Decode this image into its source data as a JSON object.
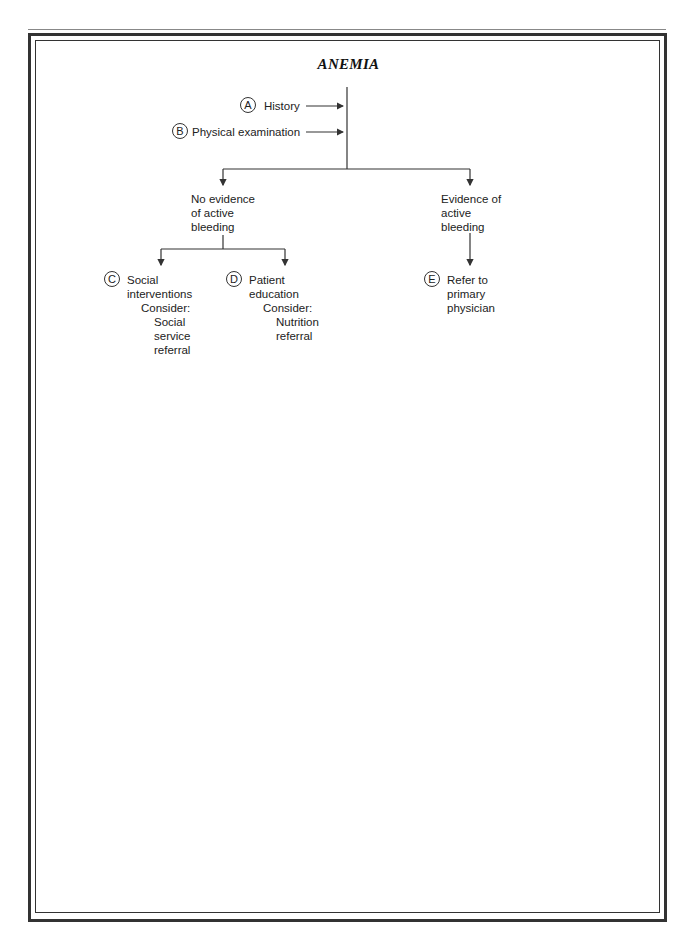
{
  "title": "ANEMIA",
  "nodes": {
    "A": {
      "letter": "A",
      "label": "History"
    },
    "B": {
      "letter": "B",
      "label": "Physical examination"
    },
    "no_bleed": {
      "lines": [
        "No evidence",
        "of active",
        "bleeding"
      ]
    },
    "bleed": {
      "lines": [
        "Evidence of",
        "active",
        "bleeding"
      ]
    },
    "C": {
      "letter": "C",
      "lines": [
        "Social",
        "interventions",
        "Consider:",
        "Social",
        "service",
        "referral"
      ]
    },
    "D": {
      "letter": "D",
      "lines": [
        "Patient",
        "education",
        "Consider:",
        "Nutrition",
        "referral"
      ]
    },
    "E": {
      "letter": "E",
      "lines": [
        "Refer to",
        "primary",
        "physician"
      ]
    }
  },
  "colors": {
    "line": "#333333",
    "text": "#222222"
  }
}
